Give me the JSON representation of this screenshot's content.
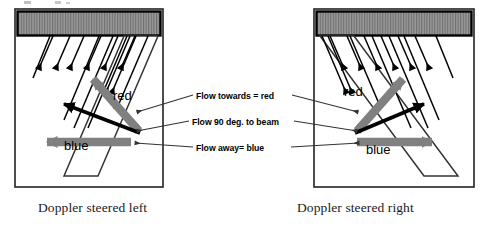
{
  "figure": {
    "title_implied": "Doppler steering and flow direction colour coding",
    "background": "#ffffff",
    "width": 487,
    "height": 228
  },
  "colors": {
    "transducer_fill": "#8f8f8f",
    "transducer_hatch": "#4a4a4a",
    "transducer_border": "#000000",
    "panel_border": "#222222",
    "beam_line": "#000000",
    "toward_arrow": "#808080",
    "away_arrow": "#808080",
    "perpendicular_arrow": "#000000",
    "leader_line": "#333333",
    "text": "#000000",
    "caption_text": "#1a1a1a"
  },
  "panels": [
    {
      "id": "left",
      "caption": "Doppler steered left",
      "steer_direction": "left",
      "transducer": {
        "name": "transducer-array",
        "hatch_style": "vertical-lines",
        "beam_count": 6
      },
      "beams": {
        "label": "ultrasound beam lines",
        "direction": "down-and-left",
        "arrowheads": 6
      },
      "flow_arrows": [
        {
          "name": "toward-flow-arrow",
          "label": "red",
          "color": "#808080",
          "meaning": "Flow towards = red",
          "direction": "up-left"
        },
        {
          "name": "perpendicular-flow-arrow",
          "label": "",
          "color": "#000000",
          "meaning": "Flow 90 deg. to beam",
          "direction": "up-left"
        },
        {
          "name": "away-flow-arrow",
          "label": "blue",
          "color": "#808080",
          "meaning": "Flow away= blue",
          "direction": "left"
        }
      ]
    },
    {
      "id": "right",
      "caption": "Doppler steered right",
      "steer_direction": "right",
      "transducer": {
        "name": "transducer-array",
        "hatch_style": "vertical-lines",
        "beam_count": 6
      },
      "beams": {
        "label": "ultrasound beam lines",
        "direction": "down-and-right",
        "arrowheads": 6
      },
      "flow_arrows": [
        {
          "name": "toward-flow-arrow",
          "label": "red",
          "color": "#808080",
          "meaning": "Flow towards = red",
          "direction": "up-right"
        },
        {
          "name": "perpendicular-flow-arrow",
          "label": "",
          "color": "#000000",
          "meaning": "Flow 90 deg. to beam",
          "direction": "up-right"
        },
        {
          "name": "away-flow-arrow",
          "label": "blue",
          "color": "#808080",
          "meaning": "Flow away= blue",
          "direction": "right"
        }
      ]
    }
  ],
  "center_legend": {
    "items": [
      {
        "key": "towards",
        "text": "Flow towards = red"
      },
      {
        "key": "ninety",
        "text": "Flow 90 deg. to beam"
      },
      {
        "key": "away",
        "text": "Flow away= blue"
      }
    ]
  },
  "labels": {
    "red_left": "red",
    "blue_left": "blue",
    "red_right": "red",
    "blue_right": "blue"
  },
  "captions": {
    "left": "Doppler steered left",
    "right": "Doppler steered right"
  }
}
